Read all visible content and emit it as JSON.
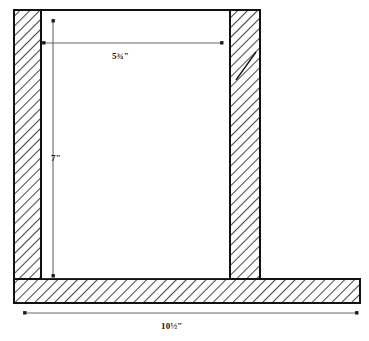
{
  "drawing": {
    "type": "cross-section-elevation",
    "title": "",
    "units": "inches",
    "line_color": "#111111",
    "hatch_color": "#555555",
    "fill_color": "#ffffff",
    "background_color": "#ffffff",
    "members": [
      {
        "name": "left-wall",
        "label": "left vertical member",
        "hatched": true,
        "x": 14,
        "y": 10,
        "width": 27,
        "height": 269
      },
      {
        "name": "right-wall",
        "label": "right vertical member",
        "hatched": true,
        "x": 230,
        "y": 10,
        "width": 30,
        "height": 269
      },
      {
        "name": "base-slab",
        "label": "bottom horizontal member",
        "hatched": true,
        "x": 14,
        "y": 279,
        "width": 346,
        "height": 24
      }
    ],
    "opening": {
      "name": "interior-opening",
      "label": "interior opening",
      "x": 41,
      "y": 10,
      "width": 189,
      "height": 269
    },
    "dimensions": [
      {
        "name": "width-dimension",
        "value": "5¾\"",
        "orientation": "horizontal",
        "x1": 44,
        "y1": 43,
        "x2": 222,
        "y2": 43,
        "label_x": 112,
        "label_y": 52
      },
      {
        "name": "height-dimension",
        "value": "7\"",
        "orientation": "vertical",
        "x1": 53,
        "y1": 21,
        "x2": 53,
        "y2": 276,
        "label_x": 51,
        "label_y": 154
      },
      {
        "name": "base-width-dimension",
        "value": "10½\"",
        "orientation": "horizontal",
        "x1": 25,
        "y1": 313,
        "x2": 357,
        "y2": 313,
        "label_x": 161,
        "label_y": 322
      }
    ]
  }
}
